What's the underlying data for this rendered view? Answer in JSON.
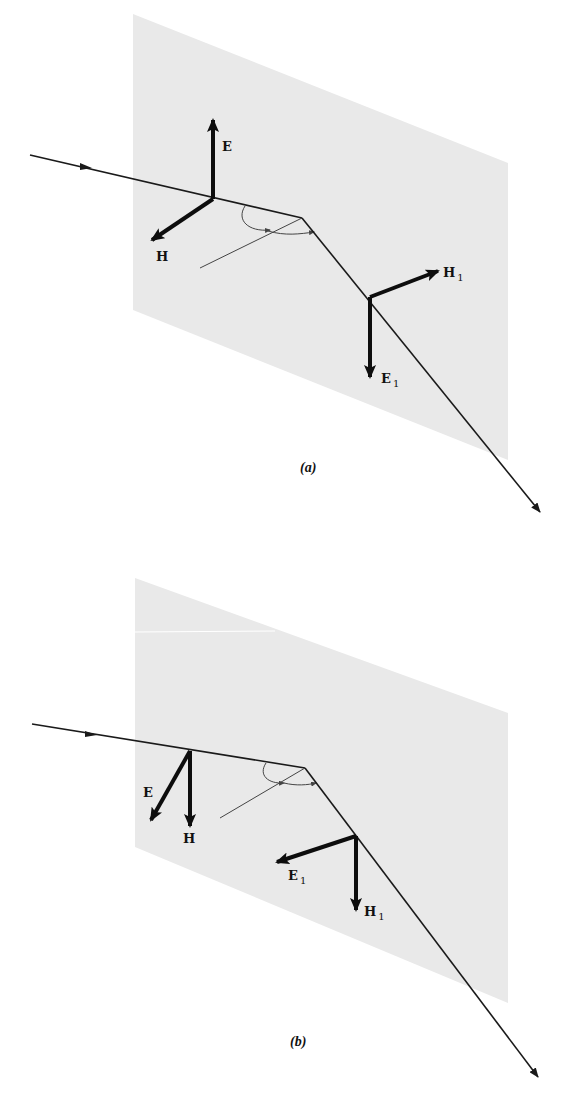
{
  "figure": {
    "colors": {
      "plane_fill": "#e9e9e9",
      "ray": "#1a1a1a",
      "vector": "#0d0d0d",
      "normal": "#333333",
      "background": "#ffffff"
    },
    "panels": [
      {
        "id": "a",
        "caption": "(a)",
        "vectors_incident": {
          "E": "E",
          "H": "H"
        },
        "vectors_refracted": {
          "E": "E",
          "H": "H",
          "subscript": "1"
        },
        "description": "E perpendicular to plane of incidence (up); H in plane"
      },
      {
        "id": "b",
        "caption": "(b)",
        "vectors_incident": {
          "E": "E",
          "H": "H"
        },
        "vectors_refracted": {
          "E": "E",
          "H": "H",
          "subscript": "1"
        },
        "description": "E in plane of incidence; H perpendicular (down)"
      }
    ]
  }
}
